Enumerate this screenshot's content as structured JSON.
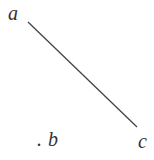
{
  "diagram": {
    "labels": {
      "a": "a",
      "b": "b",
      "c": "c",
      "dot": "."
    },
    "line": {
      "from": [
        28,
        22
      ],
      "to": [
        137,
        127
      ],
      "color": "#444444"
    }
  }
}
